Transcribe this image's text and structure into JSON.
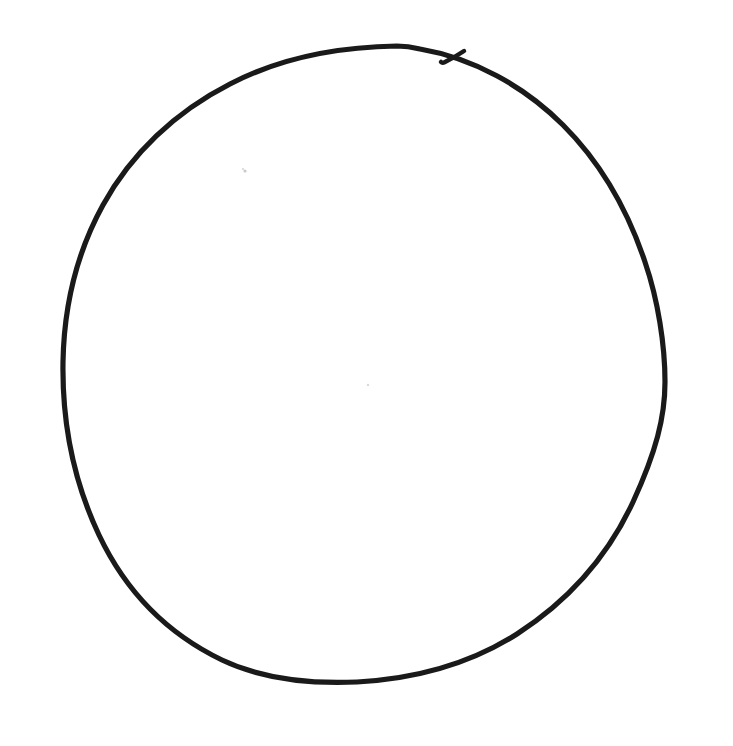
{
  "image": {
    "title": "Hand-drawn circle",
    "description": "A single freehand closed circular line drawn in black ink on plain white paper.",
    "width": 733,
    "height": 746,
    "background_color": "#ffffff",
    "medium": "ink on paper",
    "subject": "circle"
  },
  "strokes": {
    "main_outline": {
      "name": "circle-outline",
      "color": "#1a1a1a",
      "width_px": 5.2,
      "closed": true,
      "center": {
        "x": 364,
        "y": 364
      },
      "radius_x": 301,
      "radius_y": 318,
      "extents": {
        "left_x": 63,
        "right_x": 665,
        "top_y": 46,
        "bottom_y": 682
      },
      "path": "M 397 46 C 333 47 276 60 230 84 C 175 112 131 154 103 205 C 76 254 64 306 63 362 C 62 424 74 482 99 535 C 126 592 168 634 222 660 C 264 680 312 684 357 682 C 414 679 470 664 517 634 C 568 601 608 556 633 502 C 656 452 665 417 665 382 C 665 345 658 300 645 262 C 628 211 601 163 563 125 C 524 86 473 58 420 49 C 412 47 405 46 397 46 Z"
    },
    "pen_start_hook": {
      "name": "pen-start-hook",
      "color": "#1a1a1a",
      "width_px": 4.5,
      "closed": false,
      "path": "M 464 51 C 458 55 451 59 445 62 C 443 63 442 63 441 62"
    }
  },
  "specks": [
    {
      "name": "paper-speck",
      "x": 245,
      "y": 171,
      "r": 1.6,
      "color": "#c9c9c9"
    },
    {
      "name": "paper-speck",
      "x": 243,
      "y": 169,
      "r": 1.1,
      "color": "#d6d6d6"
    },
    {
      "name": "paper-speck",
      "x": 368,
      "y": 385,
      "r": 1.2,
      "color": "#dadada"
    }
  ],
  "labels": {
    "alt_text": "Hand-drawn circle"
  }
}
